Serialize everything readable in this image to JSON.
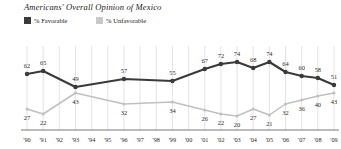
{
  "title": "Americans' Overall Opinion of Mexico",
  "legend": {
    "favorable": {
      "label": "% Favorable",
      "color": "#3a3a3a"
    },
    "unfavorable": {
      "label": "% Unfavorable",
      "color": "#c0c0c0"
    }
  },
  "chart_data": {
    "type": "line",
    "title": "Americans' Overall Opinion of Mexico",
    "xlabel": "",
    "ylabel": "",
    "ylim": [
      0,
      100
    ],
    "grid": true,
    "legend_position": "top-left",
    "categories": [
      "'90",
      "'91",
      "'92",
      "'93",
      "'94",
      "'95",
      "'96",
      "'97",
      "'98",
      "'99",
      "'00",
      "'01",
      "'02",
      "'03",
      "'04",
      "'05",
      "'06",
      "'07",
      "'08",
      "'09"
    ],
    "series": [
      {
        "name": "% Favorable",
        "color": "#3a3a3a",
        "values": [
          62,
          65,
          null,
          49,
          null,
          null,
          57,
          null,
          null,
          55,
          null,
          67,
          72,
          74,
          68,
          74,
          64,
          60,
          58,
          51
        ]
      },
      {
        "name": "% Unfavorable",
        "color": "#c0c0c0",
        "values": [
          27,
          22,
          null,
          43,
          null,
          null,
          32,
          null,
          null,
          34,
          null,
          26,
          22,
          20,
          27,
          21,
          32,
          36,
          40,
          43
        ]
      }
    ]
  }
}
